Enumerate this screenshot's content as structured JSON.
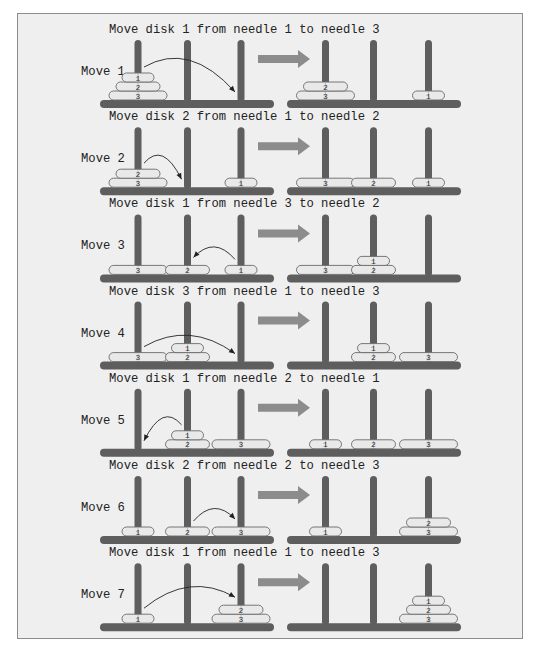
{
  "colors": {
    "panel_bg": "#efefef",
    "panel_border": "#8c8c8c",
    "needle": "#5e5e5e",
    "base": "#5e5e5e",
    "disk_fill": "#e9e9e9",
    "disk_stroke": "#6a6a6a",
    "arrow": "#8c8c8c",
    "text": "#222222",
    "curve": "#222222"
  },
  "moves": [
    {
      "label": "Move 1",
      "title": "Move disk 1 from needle 1 to needle 3",
      "before": [
        [
          3,
          2,
          1
        ],
        [],
        []
      ],
      "after": [
        [
          3,
          2
        ],
        [],
        [
          1
        ]
      ],
      "from": 1,
      "to": 3
    },
    {
      "label": "Move 2",
      "title": "Move disk 2 from needle 1 to needle 2",
      "before": [
        [
          3,
          2
        ],
        [],
        [
          1
        ]
      ],
      "after": [
        [
          3
        ],
        [
          2
        ],
        [
          1
        ]
      ],
      "from": 1,
      "to": 2
    },
    {
      "label": "Move 3",
      "title": "Move disk 1 from needle 3 to needle 2",
      "before": [
        [
          3
        ],
        [
          2
        ],
        [
          1
        ]
      ],
      "after": [
        [
          3
        ],
        [
          2,
          1
        ],
        []
      ],
      "from": 3,
      "to": 2
    },
    {
      "label": "Move 4",
      "title": "Move disk 3 from needle 1 to needle 3",
      "before": [
        [
          3
        ],
        [
          2,
          1
        ],
        []
      ],
      "after": [
        [],
        [
          2,
          1
        ],
        [
          3
        ]
      ],
      "from": 1,
      "to": 3
    },
    {
      "label": "Move 5",
      "title": "Move disk 1 from needle 2 to needle 1",
      "before": [
        [],
        [
          2,
          1
        ],
        [
          3
        ]
      ],
      "after": [
        [
          1
        ],
        [
          2
        ],
        [
          3
        ]
      ],
      "from": 2,
      "to": 1
    },
    {
      "label": "Move 6",
      "title": "Move disk 2 from needle 2 to needle 3",
      "before": [
        [
          1
        ],
        [
          2
        ],
        [
          3
        ]
      ],
      "after": [
        [
          1
        ],
        [],
        [
          3,
          2
        ]
      ],
      "from": 2,
      "to": 3
    },
    {
      "label": "Move 7",
      "title": "Move disk 1 from needle 1 to needle 3",
      "before": [
        [
          1
        ],
        [],
        [
          3,
          2
        ]
      ],
      "after": [
        [],
        [],
        [
          3,
          2,
          1
        ]
      ],
      "from": 1,
      "to": 3
    }
  ]
}
